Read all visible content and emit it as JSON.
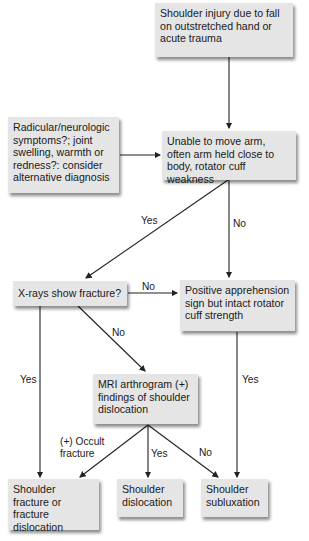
{
  "nodes": {
    "start": "Shoulder injury due to fall on outstretched hand or acute trauma",
    "exclusion": "Radicular/neurologic symptoms?; joint swelling, warmth or redness?: consider alternative diagnosis",
    "unable": "Unable to move arm, often arm held close to body, rotator cuff weakness",
    "xray": "X-rays show fracture?",
    "apprehension": "Positive apprehension sign but intact rotator cuff strength",
    "mri": "MRI arthrogram (+) findings of shoulder dislocation",
    "fracture": "Shoulder fracture or fracture dislocation",
    "dislocation": "Shoulder dislocation",
    "subluxation": "Shoulder subluxation"
  },
  "edge_labels": {
    "unable_to_xray": "Yes",
    "unable_to_apprehension": "No",
    "xray_to_apprehension": "No",
    "xray_to_mri": "No",
    "xray_to_fracture": "Yes",
    "apprehension_to_subluxation": "Yes",
    "mri_to_fracture": "(+) Occult fracture",
    "mri_to_dislocation": "Yes",
    "mri_to_subluxation": "No"
  },
  "colors": {
    "box_fill": "#e5e5e5",
    "line": "#222222"
  }
}
